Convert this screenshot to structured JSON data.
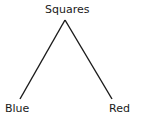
{
  "diagram": {
    "type": "tree",
    "root": {
      "label": "Squares"
    },
    "children": [
      {
        "label": "Blue"
      },
      {
        "label": "Red"
      }
    ]
  }
}
